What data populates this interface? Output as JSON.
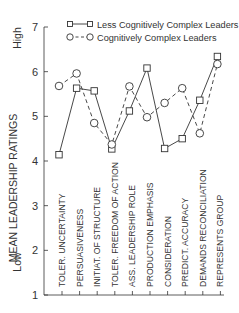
{
  "chart_data": {
    "type": "line",
    "title": "",
    "ylabel": "MEAN LEADERSHIP RATINGS",
    "xlabel": "",
    "ylim": [
      1,
      7
    ],
    "yticks": [
      1,
      2,
      3,
      4,
      5,
      6,
      7
    ],
    "y_annotations": {
      "high": "High",
      "low": "Low"
    },
    "grid": false,
    "legend_position": "top",
    "categories": [
      "TOLER. UNCERTAINTY",
      "PERSUASIVENESS",
      "INITIAT. OF STRUCTURE",
      "TOLER. FREEDOM OF ACTION",
      "ASS. LEADERSHIP ROLE",
      "PRODUCTION EMPHASIS",
      "CONSIDERATION",
      "PREDICT. ACCURACY",
      "DEMANDS RECONCILIATION",
      "REPRESENTS GROUP"
    ],
    "series": [
      {
        "name": "Less Cognitively Complex Leaders",
        "marker": "square",
        "line_style": "solid",
        "values": [
          4.14,
          5.63,
          5.57,
          4.27,
          5.12,
          6.08,
          4.28,
          4.5,
          5.36,
          6.34
        ]
      },
      {
        "name": "Cognitively Complex Leaders",
        "marker": "circle",
        "line_style": "dashed",
        "values": [
          5.68,
          5.96,
          4.85,
          4.37,
          5.67,
          4.98,
          5.3,
          5.63,
          4.62,
          6.17
        ]
      }
    ]
  }
}
